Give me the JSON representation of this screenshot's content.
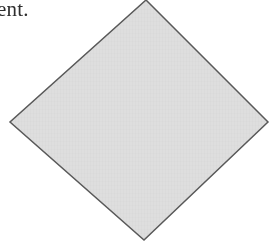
{
  "page": {
    "width": 278,
    "height": 246,
    "background_color": "#ffffff"
  },
  "text_fragment": {
    "name": "clipped-text-fragment",
    "value": "ient.",
    "color": "#2e2e2e",
    "note_clipped_at_left_edge": true
  },
  "diamond": {
    "name": "diamond-shape",
    "label": "diamond",
    "fill_color": "#dedede",
    "stroke_color": "#595959",
    "stroke_width": 1.5,
    "clipped_at_top_edge": true,
    "points": "146,0 268,122 144,240 10,122",
    "vertices": {
      "top": [
        146,
        0
      ],
      "right": [
        268,
        122
      ],
      "bottom": [
        144,
        240
      ],
      "left": [
        10,
        122
      ]
    }
  }
}
